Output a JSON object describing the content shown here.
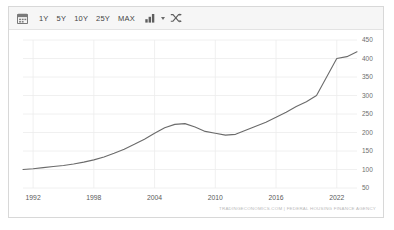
{
  "widget": {
    "attribution": "TRADINGECONOMICS.COM | FEDERAL HOUSING FINANCE AGENCY"
  },
  "toolbar": {
    "calendar_icon": "calendar-icon",
    "chart_type_icon": "bar-chart-icon",
    "compare_icon": "shuffle-compare-icon",
    "ranges": [
      {
        "label": "1Y"
      },
      {
        "label": "5Y"
      },
      {
        "label": "10Y"
      },
      {
        "label": "25Y"
      },
      {
        "label": "MAX"
      }
    ]
  },
  "colors": {
    "line": "#6b6b6b",
    "grid": "#ececec",
    "axis_text": "#5a5a5a",
    "toolbar_bg": "#f6f6f6",
    "border": "#d8d8d8"
  },
  "chart_data": {
    "type": "line",
    "title": "",
    "subtitle": "",
    "xlabel": "",
    "ylabel": "",
    "grid": true,
    "legend": "none",
    "xlim": [
      1991,
      2024
    ],
    "ylim": [
      50,
      450
    ],
    "yticks": [
      450,
      400,
      350,
      300,
      250,
      200,
      150,
      100,
      50
    ],
    "xticks": [
      1992,
      1998,
      2004,
      2010,
      2016,
      2022
    ],
    "series": [
      {
        "name": "House Price Index",
        "x": [
          1991,
          1992,
          1993,
          1994,
          1995,
          1996,
          1997,
          1998,
          1999,
          2000,
          2001,
          2002,
          2003,
          2004,
          2005,
          2006,
          2007,
          2008,
          2009,
          2010,
          2011,
          2012,
          2013,
          2014,
          2015,
          2016,
          2017,
          2018,
          2019,
          2020,
          2021,
          2022,
          2023,
          2024
        ],
        "y": [
          100,
          102,
          105,
          108,
          111,
          115,
          120,
          126,
          134,
          144,
          155,
          168,
          182,
          198,
          213,
          222,
          224,
          215,
          203,
          198,
          193,
          195,
          206,
          217,
          228,
          241,
          255,
          270,
          283,
          300,
          350,
          400,
          405,
          418
        ]
      }
    ]
  }
}
